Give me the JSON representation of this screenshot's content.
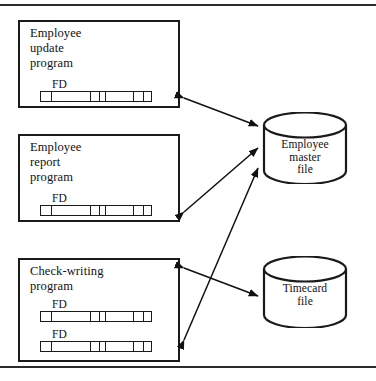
{
  "figure": {
    "has_top_rule": true,
    "has_bottom_rule": true,
    "line_color": "#1a1a1a",
    "background_color": "#ffffff"
  },
  "programs": [
    {
      "id": "employee-update-program",
      "title": "Employee\nupdate\nprogram",
      "fd_records": [
        {
          "label": "FD",
          "segments": [
            11,
            40,
            9,
            6,
            29,
            10,
            7
          ]
        }
      ]
    },
    {
      "id": "employee-report-program",
      "title": "Employee\nreport\nprogram",
      "fd_records": [
        {
          "label": "FD",
          "segments": [
            11,
            40,
            9,
            6,
            29,
            10,
            7
          ]
        }
      ]
    },
    {
      "id": "check-writing-program",
      "title": "Check-writing\nprogram",
      "fd_records": [
        {
          "label": "FD",
          "segments": [
            11,
            40,
            9,
            6,
            29,
            10,
            7
          ]
        },
        {
          "label": "FD",
          "segments": [
            11,
            40,
            9,
            6,
            29,
            10,
            7
          ]
        }
      ]
    }
  ],
  "data_stores": [
    {
      "id": "employee-master-file",
      "label": "Employee\nmaster\nfile"
    },
    {
      "id": "timecard-file",
      "label": "Timecard\nfile"
    }
  ],
  "connections": [
    {
      "id": "update-to-master",
      "from": "employee-update-program",
      "to": "employee-master-file",
      "direction": "both"
    },
    {
      "id": "report-to-master",
      "from": "employee-report-program",
      "to": "employee-master-file",
      "direction": "both"
    },
    {
      "id": "checkwriting-to-master",
      "from": "check-writing-program",
      "to": "employee-master-file",
      "direction": "both"
    },
    {
      "id": "checkwriting-to-timecard",
      "from": "check-writing-program",
      "to": "timecard-file",
      "direction": "both"
    }
  ]
}
